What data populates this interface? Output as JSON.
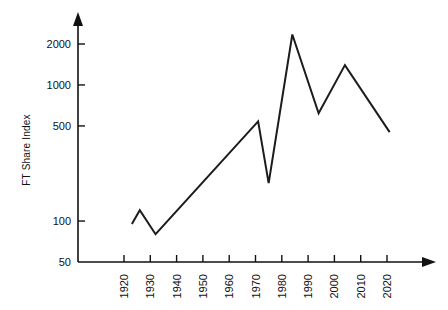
{
  "chart_data": {
    "type": "line",
    "title": "",
    "xlabel": "",
    "ylabel": "FT Share Index",
    "yscale": "log",
    "ylim": [
      50,
      2600
    ],
    "xlim": [
      1915,
      2025
    ],
    "grid": false,
    "legend": false,
    "y_ticks": [
      {
        "value": 50,
        "label": "50"
      },
      {
        "value": 100,
        "label": "100"
      },
      {
        "value": 500,
        "label": "500"
      },
      {
        "value": 1000,
        "label": "1000"
      },
      {
        "value": 2000,
        "label": "2000"
      }
    ],
    "x_ticks": [
      {
        "value": 1920,
        "label": "1920"
      },
      {
        "value": 1930,
        "label": "1930"
      },
      {
        "value": 1940,
        "label": "1940"
      },
      {
        "value": 1950,
        "label": "1950"
      },
      {
        "value": 1960,
        "label": "1960"
      },
      {
        "value": 1970,
        "label": "1970"
      },
      {
        "value": 1980,
        "label": "1980"
      },
      {
        "value": 1990,
        "label": "1990"
      },
      {
        "value": 2000,
        "label": "2000"
      },
      {
        "value": 2010,
        "label": "2010"
      },
      {
        "value": 2020,
        "label": "2020"
      }
    ],
    "series": [
      {
        "name": "FT Share Index",
        "color": "#1c1c1c",
        "x": [
          1923,
          1926,
          1932,
          1971,
          1975,
          1984,
          1994,
          2004,
          2021
        ],
        "values": [
          95,
          120,
          80,
          540,
          190,
          2350,
          620,
          1400,
          450
        ]
      }
    ]
  },
  "axis_decor": {
    "y_arrow": "arrow-up",
    "x_arrow": "arrow-right"
  }
}
